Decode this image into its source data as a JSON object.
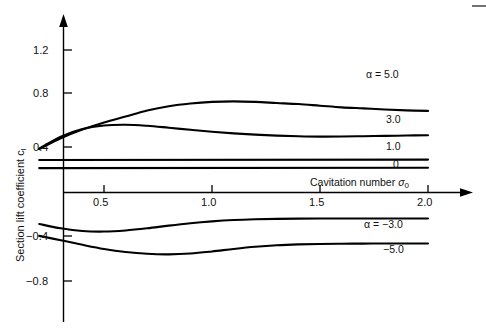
{
  "figure": {
    "background": "#ffffff",
    "ink": "#000000"
  },
  "axes": {
    "y_title_main": "Section lift coefficient c",
    "y_title_sub": "l",
    "x_title_main": "Cavitation number ",
    "x_title_sym": "σ",
    "x_title_sub": "0",
    "y_ticks": [
      "1.2",
      "0.8",
      "0.4",
      "−0.4",
      "−0.8"
    ],
    "x_ticks": [
      "0.5",
      "1.0",
      "1.5",
      "2.0"
    ]
  },
  "curve_labels": [
    {
      "text": "α = 5.0"
    },
    {
      "text": "3.0"
    },
    {
      "text": "1.0"
    },
    {
      "text": "0"
    },
    {
      "text": "α = −3.0"
    },
    {
      "text": "−5.0"
    }
  ],
  "chart_data": {
    "type": "line",
    "title": "",
    "xlabel": "Cavitation number σ₀",
    "ylabel": "Section lift coefficient c_l",
    "xlim": [
      0.2,
      2.05
    ],
    "ylim": [
      -0.95,
      1.45
    ],
    "x_ticks": [
      0.5,
      1.0,
      1.5,
      2.0
    ],
    "y_ticks": [
      1.2,
      0.8,
      0.4,
      -0.4,
      -0.8
    ],
    "grid": false,
    "legend": "inline-end-of-curve",
    "series": [
      {
        "name": "α = 5.0",
        "label": "α = 5.0",
        "x": [
          0.2,
          0.3,
          0.4,
          0.5,
          0.6,
          0.7,
          0.8,
          0.9,
          1.0,
          1.1,
          1.2,
          1.3,
          1.4,
          1.5,
          1.6,
          1.7,
          1.8,
          1.9,
          2.0
        ],
        "y": [
          0.4,
          0.5,
          0.58,
          0.645,
          0.7,
          0.755,
          0.795,
          0.82,
          0.835,
          0.84,
          0.835,
          0.825,
          0.815,
          0.8,
          0.785,
          0.775,
          0.765,
          0.757,
          0.752
        ]
      },
      {
        "name": "α = 3.0",
        "label": "3.0",
        "x": [
          0.2,
          0.3,
          0.4,
          0.5,
          0.6,
          0.7,
          0.8,
          0.9,
          1.0,
          1.1,
          1.2,
          1.3,
          1.4,
          1.5,
          1.6,
          1.7,
          1.8,
          1.9,
          2.0
        ],
        "y": [
          0.405,
          0.515,
          0.585,
          0.618,
          0.625,
          0.615,
          0.597,
          0.578,
          0.56,
          0.545,
          0.533,
          0.524,
          0.518,
          0.515,
          0.516,
          0.519,
          0.522,
          0.525,
          0.528
        ]
      },
      {
        "name": "α = 1.0",
        "label": "1.0",
        "x": [
          0.2,
          2.0
        ],
        "y": [
          0.3,
          0.303
        ]
      },
      {
        "name": "α = 0",
        "label": "0",
        "x": [
          0.2,
          2.0
        ],
        "y": [
          0.225,
          0.228
        ]
      },
      {
        "name": "α = −3.0",
        "label": "α = −3.0",
        "x": [
          0.2,
          0.3,
          0.4,
          0.5,
          0.6,
          0.7,
          0.8,
          0.9,
          1.0,
          1.1,
          1.2,
          1.3,
          1.4,
          1.5,
          1.6,
          1.7,
          1.8,
          1.9,
          2.0
        ],
        "y": [
          -0.29,
          -0.33,
          -0.355,
          -0.36,
          -0.35,
          -0.33,
          -0.305,
          -0.283,
          -0.266,
          -0.254,
          -0.247,
          -0.243,
          -0.241,
          -0.24,
          -0.24,
          -0.24,
          -0.24,
          -0.24,
          -0.24
        ]
      },
      {
        "name": "α = −5.0",
        "label": "−5.0",
        "x": [
          0.2,
          0.3,
          0.4,
          0.5,
          0.6,
          0.7,
          0.8,
          0.9,
          1.0,
          1.1,
          1.2,
          1.3,
          1.4,
          1.5,
          1.6,
          1.7,
          1.8,
          1.9,
          2.0
        ],
        "y": [
          -0.4,
          -0.44,
          -0.482,
          -0.52,
          -0.548,
          -0.565,
          -0.57,
          -0.562,
          -0.543,
          -0.52,
          -0.5,
          -0.486,
          -0.478,
          -0.474,
          -0.472,
          -0.471,
          -0.47,
          -0.47,
          -0.47
        ]
      }
    ]
  }
}
